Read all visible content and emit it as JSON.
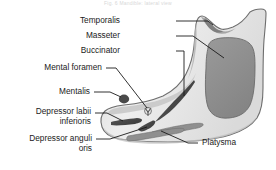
{
  "figure": {
    "caption_top": "Fig. 6  Mandible: lateral view",
    "colors": {
      "bone_light": "#eeeeee",
      "bone_mid": "#d9d9d9",
      "bone_shadow": "#c2c2c2",
      "masseter_fill": "#8f8f8f",
      "muscle_dark": "#4a4a4a",
      "outline": "#6e6e6e",
      "leader": "#1b1b1b",
      "text": "#1b1b1b",
      "background": "#ffffff"
    },
    "labels": [
      {
        "id": "temporalis",
        "text": "Temporalis",
        "text2": "",
        "side": "right",
        "x": 118,
        "y": 16
      },
      {
        "id": "masseter",
        "text": "Masseter",
        "text2": "",
        "side": "right",
        "x": 125,
        "y": 31
      },
      {
        "id": "buccinator",
        "text": "Buccinator",
        "text2": "",
        "side": "right",
        "x": 120,
        "y": 46
      },
      {
        "id": "mental-foramen",
        "text": "Mental foramen",
        "text2": "",
        "side": "right",
        "x": 12,
        "y": 63
      },
      {
        "id": "mentalis",
        "text": "Mentalis",
        "text2": "",
        "side": "right",
        "x": 47,
        "y": 88
      },
      {
        "id": "depressor-labii-inferioris",
        "text": "Depressor labii",
        "text2": "inferioris",
        "side": "right",
        "x": 18,
        "y": 109
      },
      {
        "id": "depressor-anguli-oris",
        "text": "Depressor anguli",
        "text2": "oris",
        "side": "right",
        "x": 8,
        "y": 135
      },
      {
        "id": "platysma",
        "text": "Platysma",
        "text2": "",
        "side": "left",
        "x": 200,
        "y": 139
      }
    ],
    "leaders": [
      {
        "id": "leader-temporalis",
        "path": "M 176 21 L 208 21 L 213 25"
      },
      {
        "id": "leader-masseter",
        "path": "M 176 36 L 192 36 L 223 57"
      },
      {
        "id": "leader-buccinator",
        "path": "M 176 51 L 184 51 L 184 95"
      },
      {
        "id": "leader-mental-foramen",
        "path": "M 106 68 L 116 68 L 148 110"
      },
      {
        "id": "leader-mentalis",
        "path": "M 94 92 L 110 92 L 122 98"
      },
      {
        "id": "leader-depressor-labii-inferioris",
        "path": "M 95 113 L 107 113 L 124 122"
      },
      {
        "id": "leader-depressor-anguli-oris",
        "path": "M 96 139 L 110 139 L 147 126"
      },
      {
        "id": "leader-platysma",
        "path": "M 198 143 L 188 143 L 162 130"
      }
    ],
    "muscle_marks": [
      {
        "id": "buccinator-stripe",
        "kind": "stripe"
      },
      {
        "id": "masseter-area",
        "kind": "area"
      },
      {
        "id": "temporalis-area",
        "kind": "area"
      },
      {
        "id": "mentalis-mark",
        "kind": "oval"
      },
      {
        "id": "mental-foramen-mark",
        "kind": "foramen"
      },
      {
        "id": "depressor-labii-inferioris-stripe",
        "kind": "stripe"
      },
      {
        "id": "depressor-anguli-oris-stripe",
        "kind": "stripe"
      },
      {
        "id": "platysma-stripe-upper",
        "kind": "stripe"
      },
      {
        "id": "platysma-stripe-lower",
        "kind": "stripe"
      }
    ]
  }
}
